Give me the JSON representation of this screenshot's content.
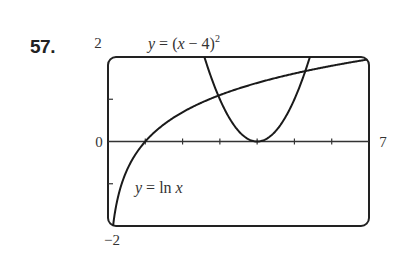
{
  "problem_number": "57.",
  "chart_data": {
    "type": "line",
    "title": "",
    "xlabel": "",
    "ylabel": "",
    "xlim": [
      0,
      7
    ],
    "ylim": [
      -2,
      2
    ],
    "x_ticks": [
      1,
      2,
      3,
      4,
      5,
      6
    ],
    "y_ticks": [
      -1,
      1
    ],
    "grid": false,
    "axis_labels": {
      "xmin": "0",
      "xmax": "7",
      "ymax": "2",
      "ymin": "−2"
    },
    "series": [
      {
        "name": "y = (x − 4)^2",
        "label": "y = (x − 4)",
        "superscript": "2",
        "function": "(x-4)^2",
        "x": [
          2.586,
          3,
          3.5,
          4,
          4.5,
          5,
          5.414
        ],
        "values": [
          2,
          1,
          0.25,
          0,
          0.25,
          1,
          2
        ]
      },
      {
        "name": "y = ln x",
        "label": "y = ln x",
        "function": "ln(x)",
        "x": [
          0.135,
          0.5,
          1,
          2,
          3,
          4,
          5,
          6,
          7
        ],
        "values": [
          -2,
          -0.693,
          0,
          0.693,
          1.099,
          1.386,
          1.609,
          1.792,
          1.946
        ]
      }
    ],
    "intersections_visible": [
      {
        "x": 2.59,
        "y": 0.95
      },
      {
        "x": 5.35,
        "y": 1.68
      }
    ]
  }
}
